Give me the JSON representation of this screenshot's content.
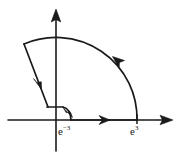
{
  "figure": {
    "kind": "complex-plane-contour-diagram",
    "background_color": "#ffffff",
    "ink_color": "#1a1a1a",
    "width": 176,
    "height": 164
  },
  "axes": {
    "x_axis": {
      "name": "real-axis",
      "arrow_direction": "right",
      "start_x": 8,
      "end_x": 172,
      "y": 120
    },
    "y_axis": {
      "name": "imaginary-axis",
      "arrow_direction": "up",
      "x": 56,
      "top_y": 10,
      "bottom_y": 151
    }
  },
  "labels": {
    "inner_radius": {
      "base": "e",
      "exponent": "−3",
      "full_text": "e−3",
      "x": 58,
      "y": 126
    },
    "outer_radius": {
      "base": "e",
      "exponent": "3",
      "full_text": "e3",
      "x": 130,
      "y": 126
    }
  },
  "contour": {
    "description": "closed keyhole sector contour in the first/second quadrant",
    "outer_radius_value": "e^3",
    "inner_radius_value": "e^-3",
    "origin": {
      "x": 56,
      "y": 120
    },
    "segments": [
      {
        "name": "outer-arc",
        "type": "arc",
        "radius_px": 81,
        "from": {
          "x": 137,
          "y": 120
        },
        "to": {
          "x": 24,
          "y": 44
        },
        "orientation": "counterclockwise",
        "arrow_at": {
          "x": 116,
          "y": 60
        },
        "arrow_direction": "up-left"
      },
      {
        "name": "radial-line-inbound",
        "type": "line",
        "from": {
          "x": 24,
          "y": 44
        },
        "to": {
          "x": 48,
          "y": 107
        },
        "arrow_at": {
          "x": 38,
          "y": 80
        },
        "arrow_direction": "down-right"
      },
      {
        "name": "inner-horizontal-segment",
        "type": "line",
        "from": {
          "x": 48,
          "y": 107
        },
        "to": {
          "x": 62,
          "y": 107
        }
      },
      {
        "name": "inner-arc",
        "type": "arc",
        "radius_px": 14,
        "from": {
          "x": 62,
          "y": 107
        },
        "to": {
          "x": 70,
          "y": 120
        },
        "orientation": "clockwise",
        "arrow_at": {
          "x": 68,
          "y": 116
        },
        "arrow_direction": "down-right"
      },
      {
        "name": "real-axis-segment-outbound",
        "type": "line",
        "from": {
          "x": 70,
          "y": 120
        },
        "to": {
          "x": 137,
          "y": 120
        },
        "arrow_at": {
          "x": 104,
          "y": 120
        },
        "arrow_direction": "right"
      }
    ]
  }
}
